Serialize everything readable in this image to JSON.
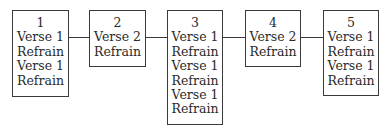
{
  "diagram": {
    "boxes": [
      {
        "number": "1",
        "lines": [
          "Verse 1",
          "Refrain",
          "Verse 1",
          "Refrain"
        ]
      },
      {
        "number": "2",
        "lines": [
          "Verse 2",
          "Refrain"
        ]
      },
      {
        "number": "3",
        "lines": [
          "Verse 1",
          "Refrain",
          "Verse 1",
          "Refrain",
          "Verse 1",
          "Refrain"
        ]
      },
      {
        "number": "4",
        "lines": [
          "Verse 2",
          "Refrain"
        ]
      },
      {
        "number": "5",
        "lines": [
          "Verse 1",
          "Refrain",
          "Verse 1",
          "Refrain"
        ]
      }
    ],
    "connections": [
      [
        "1",
        "2"
      ],
      [
        "2",
        "3"
      ],
      [
        "3",
        "4"
      ],
      [
        "4",
        "5"
      ]
    ],
    "colors": {
      "stroke": "#3a3a3a",
      "text": "#2a2a2a",
      "background": "#ffffff"
    }
  }
}
